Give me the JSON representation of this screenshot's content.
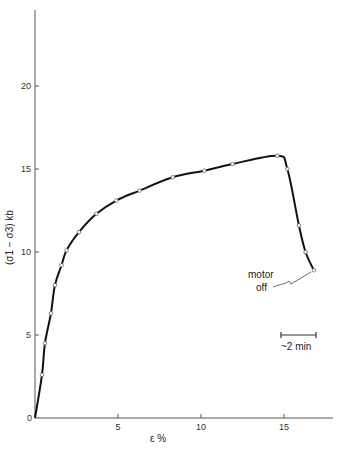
{
  "chart_data": {
    "type": "line",
    "title": "",
    "xlabel": "ε %",
    "ylabel": "(σ1 − σ3)  kb",
    "xlim": [
      0,
      18
    ],
    "ylim": [
      0,
      25
    ],
    "grid": false,
    "xticks": [
      "0",
      "5",
      "10",
      "15"
    ],
    "yticks": [
      "0",
      "5",
      "10",
      "15",
      "20"
    ],
    "series": [
      {
        "name": "stress-strain",
        "x": [
          0,
          0.42,
          0.6,
          0.96,
          1.2,
          1.6,
          1.9,
          2.65,
          3.7,
          4.9,
          6.3,
          8.3,
          10.2,
          11.9,
          14.6,
          15.2,
          15.9,
          16.3,
          16.8
        ],
        "y": [
          0,
          2.6,
          4.5,
          6.3,
          8.0,
          9.2,
          10.1,
          11.2,
          12.3,
          13.1,
          13.7,
          14.5,
          14.9,
          15.3,
          15.8,
          15.0,
          11.6,
          10.0,
          8.9
        ]
      }
    ],
    "annotations": [
      {
        "text_line1": "motor",
        "text_line2": "off",
        "points_to": [
          16.8,
          8.9
        ]
      },
      {
        "text": "~2 min",
        "type": "scale-bar",
        "x_range": [
          14.9,
          17.0
        ],
        "y": 5.0
      }
    ]
  }
}
